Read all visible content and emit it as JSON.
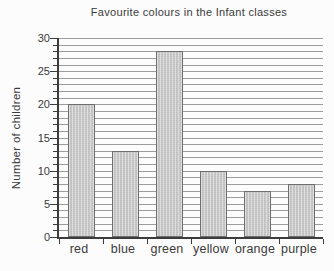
{
  "chart_data": {
    "type": "bar",
    "title": "Favourite colours in the Infant classes",
    "ylabel": "Number of children",
    "xlabel": "",
    "categories": [
      "red",
      "blue",
      "green",
      "yellow",
      "orange",
      "purple"
    ],
    "values": [
      20,
      13,
      28,
      10,
      7,
      8
    ],
    "ylim": [
      0,
      30
    ],
    "ytick_label_step": 5,
    "gridline_step": 1,
    "grid": "horizontal",
    "legend": "none",
    "colors": {
      "background": "#fcfcfc",
      "bar_fill": "#c8c8c8",
      "bar_border": "#6e6e6e",
      "gridline": "#9c9c9c",
      "axis": "#3c3c3c",
      "text": "#3a3a3a"
    }
  }
}
